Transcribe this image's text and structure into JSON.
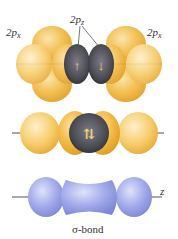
{
  "diagram": {
    "panels": [
      {
        "id": "separate-orbitals",
        "labels": {
          "left_orbital": "2p",
          "left_orbital_sub": "x",
          "center_orbital": "2p",
          "center_orbital_sub": "z",
          "right_orbital": "2p",
          "right_orbital_sub": "x"
        },
        "electrons": [
          "↑",
          "↓"
        ],
        "colors": {
          "lobe": "#f0b73a",
          "overlap": "#55565e"
        }
      },
      {
        "id": "overlapping-orbitals",
        "electrons": "↑↓",
        "colors": {
          "lobe": "#f3c55a",
          "overlap": "#4e4f55"
        }
      },
      {
        "id": "sigma-bond",
        "axis_label": "z",
        "colors": {
          "lobe": "#9aa3e6"
        }
      }
    ],
    "caption": "σ-bond"
  }
}
